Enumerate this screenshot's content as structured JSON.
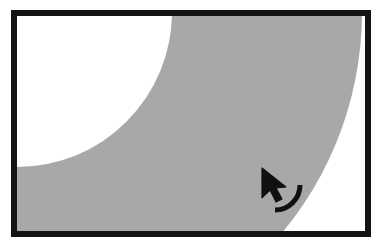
{
  "canvas": {
    "width": 382,
    "height": 248,
    "background_color": "#ffffff"
  },
  "frame": {
    "name": "image-border-frame",
    "color": "#141414",
    "thickness": 6,
    "left": 11,
    "top": 10,
    "right": 371,
    "bottom": 237
  },
  "figure": {
    "title": "",
    "inner_background_color": "#ffffff",
    "band": {
      "label": "gray-crescent-band",
      "fill_color": "#a8a8a8",
      "description": "Gray annulus band curving from upper-left down to lower-right",
      "outer_arc": {
        "center_x": 17,
        "center_y": 12,
        "radius": 345
      },
      "inner_arc": {
        "center_x": 17,
        "center_y": 12,
        "radius": 155
      }
    }
  },
  "cursor": {
    "name": "mouse-pointer",
    "type": "arrow",
    "color": "#101010",
    "tip_x": 262,
    "tip_y": 168,
    "size": 26
  },
  "gesture": {
    "name": "drag-arc-indicator",
    "type": "quarter-arc",
    "color": "#101010",
    "stroke_width": 5,
    "center_x": 275,
    "center_y": 185,
    "radius": 25,
    "start_angle_deg": 0,
    "end_angle_deg": 90
  },
  "colors": {
    "frame": "#141414",
    "band": "#a8a8a8",
    "background": "#ffffff",
    "cursor": "#101010"
  },
  "accessibility": {
    "alt_text": "Framed diagram showing a gray crescent band with a mouse pointer and a curved drag gesture arc"
  }
}
